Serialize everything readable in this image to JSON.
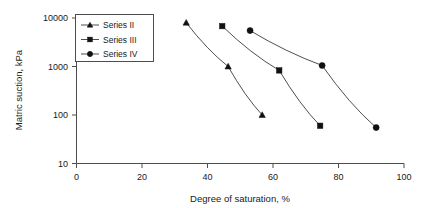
{
  "chart_data": {
    "type": "line",
    "title": "",
    "xlabel": "Degree of saturation, %",
    "ylabel": "Matric suction, kPa",
    "xlim": [
      0,
      100
    ],
    "ylim": [
      10,
      10000
    ],
    "yscale": "log",
    "xscale": "linear",
    "grid": false,
    "legend_position": "top-left",
    "xticks": [
      0,
      20,
      40,
      60,
      80,
      100
    ],
    "xtick_labels": [
      "0",
      "20",
      "40",
      "60",
      "80",
      "100"
    ],
    "yticks": [
      10,
      100,
      1000,
      10000
    ],
    "ytick_labels": [
      "10",
      "100",
      "1000",
      "10000"
    ],
    "series": [
      {
        "name": "Series II",
        "marker": "triangle",
        "color": "#111111",
        "x": [
          33.5,
          46.3,
          56.7
        ],
        "y": [
          8000,
          1000,
          100
        ]
      },
      {
        "name": "Series III",
        "marker": "square",
        "color": "#111111",
        "x": [
          44.5,
          61.9,
          74.4
        ],
        "y": [
          6800,
          830,
          60
        ]
      },
      {
        "name": "Series IV",
        "marker": "circle",
        "color": "#111111",
        "x": [
          53.0,
          75.0,
          91.5
        ],
        "y": [
          5500,
          1050,
          55
        ]
      }
    ]
  },
  "legend": {
    "entries": [
      {
        "label": "Series II",
        "marker": "triangle"
      },
      {
        "label": "Series III",
        "marker": "square"
      },
      {
        "label": "Series IV",
        "marker": "circle"
      }
    ]
  },
  "axes": {
    "x_title": "Degree of saturation, %",
    "y_title": "Matric suction, kPa"
  }
}
